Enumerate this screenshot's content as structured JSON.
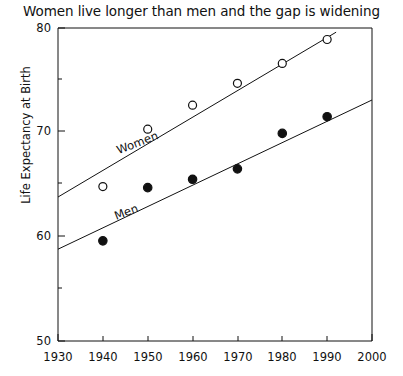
{
  "chart_data": {
    "type": "scatter",
    "title": "Women live longer than men and the gap is widening",
    "xlabel": "",
    "ylabel": "Life Expectancy at Birth",
    "xlim": [
      1930,
      2000
    ],
    "ylim": [
      50,
      80
    ],
    "xticks": [
      "1930",
      "1940",
      "1950",
      "1960",
      "1970",
      "1980",
      "1990",
      "2000"
    ],
    "yticks": [
      "50",
      "60",
      "70",
      "80"
    ],
    "y_minor_ticks": [
      55,
      65,
      75
    ],
    "grid": false,
    "legend_position": "inline-along-trendlines",
    "x": [
      1940,
      1950,
      1960,
      1970,
      1980,
      1990
    ],
    "series": [
      {
        "name": "Women",
        "marker": "open-circle",
        "color": "#111111",
        "values": [
          64.8,
          70.3,
          72.6,
          74.7,
          76.6,
          78.9
        ],
        "trendline": {
          "x_start": 1930,
          "y_start": 63.8,
          "x_end": 1992,
          "y_end": 79.6
        },
        "annotation": {
          "text": "Women",
          "x": 1943.5,
          "y": 67.9,
          "rotation": -21
        }
      },
      {
        "name": "Men",
        "marker": "filled-circle",
        "color": "#111111",
        "values": [
          59.6,
          64.7,
          65.5,
          66.5,
          69.9,
          71.5
        ],
        "trendline": {
          "x_start": 1930,
          "y_start": 58.8,
          "x_end": 2000,
          "y_end": 73.1
        },
        "annotation": {
          "text": "Men",
          "x": 1943.0,
          "y": 61.6,
          "rotation": -21
        }
      }
    ]
  },
  "axis": {
    "y_title": "Life Expectancy at Birth",
    "y_tick_50": "50",
    "y_tick_60": "60",
    "y_tick_70": "70",
    "y_tick_80": "80",
    "x_tick_1930": "1930",
    "x_tick_1940": "1940",
    "x_tick_1950": "1950",
    "x_tick_1960": "1960",
    "x_tick_1970": "1970",
    "x_tick_1980": "1980",
    "x_tick_1990": "1990",
    "x_tick_2000": "2000"
  },
  "labels": {
    "women": "Women",
    "men": "Men"
  }
}
